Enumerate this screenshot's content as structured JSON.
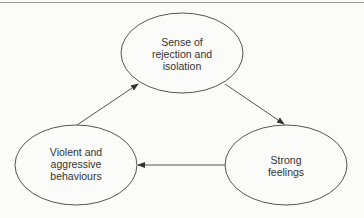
{
  "diagram": {
    "type": "cycle",
    "colors": {
      "stroke": "#555555",
      "text": "#333333",
      "background": "#fbfbfa"
    },
    "nodes": [
      {
        "id": "rejection",
        "lines": [
          "Sense of",
          "rejection and",
          "isolation"
        ],
        "cx": 182,
        "cy": 53,
        "rx": 61,
        "ry": 40
      },
      {
        "id": "feelings",
        "lines": [
          "Strong",
          "feelings"
        ],
        "cx": 286,
        "cy": 165,
        "rx": 61,
        "ry": 40
      },
      {
        "id": "behaviours",
        "lines": [
          "Violent and",
          "aggressive",
          "behaviours"
        ],
        "cx": 76,
        "cy": 165,
        "rx": 61,
        "ry": 40
      }
    ],
    "edges": [
      {
        "from": "rejection",
        "to": "feelings"
      },
      {
        "from": "feelings",
        "to": "behaviours"
      },
      {
        "from": "behaviours",
        "to": "rejection"
      }
    ]
  }
}
